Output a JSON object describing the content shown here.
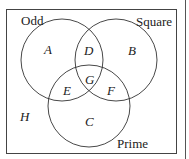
{
  "diagram": {
    "type": "venn",
    "sets": [
      {
        "name": "Odd"
      },
      {
        "name": "Square"
      },
      {
        "name": "Prime"
      }
    ],
    "regions": {
      "A": "A",
      "B": "B",
      "C": "C",
      "D": "D",
      "E": "E",
      "F": "F",
      "G": "G",
      "H": "H"
    },
    "colors": {
      "stroke": "#333333",
      "background": "#ffffff"
    }
  }
}
